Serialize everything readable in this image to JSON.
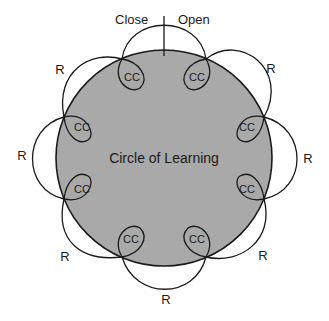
{
  "diagram": {
    "center_label": "Circle of Learning",
    "top_left_label": "Close",
    "top_right_label": "Open",
    "circle_fill": "#a9a9a9",
    "stroke_color": "#1a1a1a",
    "nodes": [
      {
        "label": "CC",
        "x": 132,
        "y": 77
      },
      {
        "label": "CC",
        "x": 197,
        "y": 77
      },
      {
        "label": "CC",
        "x": 246,
        "y": 126
      },
      {
        "label": "CC",
        "x": 246,
        "y": 190
      },
      {
        "label": "CC",
        "x": 197,
        "y": 238
      },
      {
        "label": "CC",
        "x": 132,
        "y": 238
      },
      {
        "label": "CC",
        "x": 83,
        "y": 190
      },
      {
        "label": "CC",
        "x": 83,
        "y": 126
      }
    ],
    "petals": [
      {
        "label": "R",
        "x": 270,
        "y": 68
      },
      {
        "label": "R",
        "x": 308,
        "y": 158
      },
      {
        "label": "R",
        "x": 263,
        "y": 254
      },
      {
        "label": "R",
        "x": 166,
        "y": 299
      },
      {
        "label": "R",
        "x": 65,
        "y": 256
      },
      {
        "label": "R",
        "x": 22,
        "y": 155
      },
      {
        "label": "R",
        "x": 60,
        "y": 69
      }
    ]
  }
}
